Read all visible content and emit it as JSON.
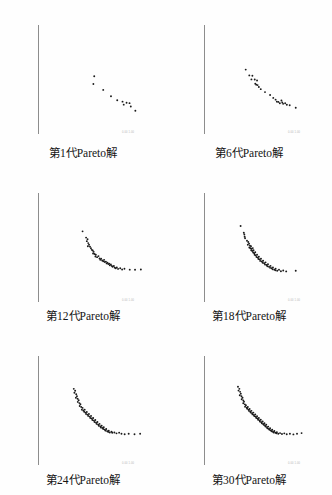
{
  "figure": {
    "type": "scatter-grid",
    "columns": 2,
    "rows": 3,
    "background_color": "#fefefe",
    "axis_color": "#8d8d8d",
    "point_color": "#1a1a1a",
    "axis_micro_label": "0.00  1.00"
  },
  "chart_data": [
    {
      "type": "scatter",
      "title": "第1代Pareto解",
      "generation": 1,
      "point_count": 11,
      "xlabel": "",
      "ylabel": "",
      "grid": false,
      "legend": null,
      "projection": "3d-axes",
      "xlim": [
        0,
        1
      ],
      "ylim": [
        0,
        1
      ],
      "points": [
        [
          0.455,
          0.615
        ],
        [
          0.447,
          0.528
        ],
        [
          0.54,
          0.462
        ],
        [
          0.613,
          0.39
        ],
        [
          0.672,
          0.345
        ],
        [
          0.722,
          0.33
        ],
        [
          0.733,
          0.296
        ],
        [
          0.76,
          0.318
        ],
        [
          0.788,
          0.313
        ],
        [
          0.8,
          0.275
        ],
        [
          0.843,
          0.228
        ]
      ]
    },
    {
      "type": "scatter",
      "title": "第6代Pareto解",
      "generation": 6,
      "point_count": 25,
      "xlabel": "",
      "ylabel": "",
      "grid": false,
      "legend": null,
      "projection": "3d-axes",
      "xlim": [
        0,
        1
      ],
      "ylim": [
        0,
        1
      ],
      "points": [
        [
          0.318,
          0.69
        ],
        [
          0.352,
          0.625
        ],
        [
          0.381,
          0.62
        ],
        [
          0.372,
          0.58
        ],
        [
          0.403,
          0.578
        ],
        [
          0.425,
          0.568
        ],
        [
          0.408,
          0.532
        ],
        [
          0.417,
          0.521
        ],
        [
          0.43,
          0.516
        ],
        [
          0.442,
          0.495
        ],
        [
          0.46,
          0.47
        ],
        [
          0.5,
          0.437
        ],
        [
          0.548,
          0.405
        ],
        [
          0.578,
          0.372
        ],
        [
          0.6,
          0.352
        ],
        [
          0.612,
          0.33
        ],
        [
          0.626,
          0.327
        ],
        [
          0.64,
          0.312
        ],
        [
          0.655,
          0.342
        ],
        [
          0.663,
          0.32
        ],
        [
          0.671,
          0.305
        ],
        [
          0.69,
          0.312
        ],
        [
          0.706,
          0.295
        ],
        [
          0.733,
          0.29
        ],
        [
          0.79,
          0.262
        ]
      ]
    },
    {
      "type": "scatter",
      "title": "第12代Pareto解",
      "generation": 12,
      "point_count": 45,
      "xlabel": "",
      "ylabel": "",
      "grid": false,
      "legend": null,
      "projection": "3d-axes",
      "xlim": [
        0,
        1
      ],
      "ylim": [
        0,
        1
      ],
      "points": [
        [
          0.345,
          0.76
        ],
        [
          0.378,
          0.69
        ],
        [
          0.392,
          0.672
        ],
        [
          0.385,
          0.65
        ],
        [
          0.398,
          0.628
        ],
        [
          0.406,
          0.61
        ],
        [
          0.395,
          0.592
        ],
        [
          0.415,
          0.588
        ],
        [
          0.424,
          0.57
        ],
        [
          0.432,
          0.552
        ],
        [
          0.441,
          0.545
        ],
        [
          0.45,
          0.53
        ],
        [
          0.444,
          0.512
        ],
        [
          0.458,
          0.505
        ],
        [
          0.47,
          0.498
        ],
        [
          0.466,
          0.478
        ],
        [
          0.482,
          0.47
        ],
        [
          0.495,
          0.482
        ],
        [
          0.505,
          0.455
        ],
        [
          0.512,
          0.44
        ],
        [
          0.52,
          0.452
        ],
        [
          0.53,
          0.432
        ],
        [
          0.54,
          0.425
        ],
        [
          0.548,
          0.44
        ],
        [
          0.555,
          0.415
        ],
        [
          0.565,
          0.42
        ],
        [
          0.572,
          0.4
        ],
        [
          0.58,
          0.408
        ],
        [
          0.588,
          0.392
        ],
        [
          0.596,
          0.398
        ],
        [
          0.602,
          0.38
        ],
        [
          0.612,
          0.388
        ],
        [
          0.62,
          0.372
        ],
        [
          0.628,
          0.362
        ],
        [
          0.64,
          0.37
        ],
        [
          0.648,
          0.352
        ],
        [
          0.658,
          0.345
        ],
        [
          0.668,
          0.355
        ],
        [
          0.68,
          0.338
        ],
        [
          0.7,
          0.345
        ],
        [
          0.718,
          0.332
        ],
        [
          0.74,
          0.34
        ],
        [
          0.79,
          0.33
        ],
        [
          0.84,
          0.328
        ],
        [
          0.895,
          0.332
        ]
      ]
    },
    {
      "type": "scatter",
      "title": "第18代Pareto解",
      "generation": 18,
      "point_count": 55,
      "xlabel": "",
      "ylabel": "",
      "grid": false,
      "legend": null,
      "projection": "3d-axes",
      "xlim": [
        0,
        1
      ],
      "ylim": [
        0,
        1
      ],
      "points": [
        [
          0.27,
          0.82
        ],
        [
          0.3,
          0.745
        ],
        [
          0.305,
          0.725
        ],
        [
          0.308,
          0.7
        ],
        [
          0.312,
          0.682
        ],
        [
          0.33,
          0.655
        ],
        [
          0.342,
          0.64
        ],
        [
          0.35,
          0.622
        ],
        [
          0.338,
          0.61
        ],
        [
          0.358,
          0.6
        ],
        [
          0.368,
          0.592
        ],
        [
          0.352,
          0.578
        ],
        [
          0.362,
          0.57
        ],
        [
          0.375,
          0.565
        ],
        [
          0.385,
          0.572
        ],
        [
          0.37,
          0.548
        ],
        [
          0.38,
          0.54
        ],
        [
          0.392,
          0.548
        ],
        [
          0.388,
          0.522
        ],
        [
          0.398,
          0.515
        ],
        [
          0.408,
          0.525
        ],
        [
          0.402,
          0.498
        ],
        [
          0.412,
          0.49
        ],
        [
          0.425,
          0.498
        ],
        [
          0.42,
          0.472
        ],
        [
          0.432,
          0.465
        ],
        [
          0.442,
          0.475
        ],
        [
          0.438,
          0.45
        ],
        [
          0.45,
          0.445
        ],
        [
          0.462,
          0.452
        ],
        [
          0.455,
          0.428
        ],
        [
          0.47,
          0.422
        ],
        [
          0.482,
          0.43
        ],
        [
          0.478,
          0.408
        ],
        [
          0.492,
          0.402
        ],
        [
          0.505,
          0.412
        ],
        [
          0.5,
          0.388
        ],
        [
          0.515,
          0.382
        ],
        [
          0.528,
          0.39
        ],
        [
          0.522,
          0.368
        ],
        [
          0.538,
          0.362
        ],
        [
          0.552,
          0.372
        ],
        [
          0.548,
          0.35
        ],
        [
          0.562,
          0.345
        ],
        [
          0.575,
          0.355
        ],
        [
          0.572,
          0.335
        ],
        [
          0.588,
          0.33
        ],
        [
          0.6,
          0.34
        ],
        [
          0.598,
          0.322
        ],
        [
          0.615,
          0.318
        ],
        [
          0.632,
          0.328
        ],
        [
          0.65,
          0.312
        ],
        [
          0.672,
          0.32
        ],
        [
          0.7,
          0.31
        ],
        [
          0.79,
          0.318
        ]
      ]
    },
    {
      "type": "scatter",
      "title": "第24代Pareto解",
      "generation": 24,
      "point_count": 62,
      "xlabel": "",
      "ylabel": "",
      "grid": false,
      "legend": null,
      "projection": "3d-axes",
      "xlim": [
        0,
        1
      ],
      "ylim": [
        0,
        1
      ],
      "points": [
        [
          0.262,
          0.822
        ],
        [
          0.275,
          0.8
        ],
        [
          0.268,
          0.778
        ],
        [
          0.285,
          0.762
        ],
        [
          0.292,
          0.74
        ],
        [
          0.282,
          0.722
        ],
        [
          0.298,
          0.71
        ],
        [
          0.308,
          0.695
        ],
        [
          0.3,
          0.675
        ],
        [
          0.315,
          0.662
        ],
        [
          0.325,
          0.65
        ],
        [
          0.318,
          0.63
        ],
        [
          0.332,
          0.618
        ],
        [
          0.345,
          0.608
        ],
        [
          0.338,
          0.588
        ],
        [
          0.352,
          0.578
        ],
        [
          0.365,
          0.588
        ],
        [
          0.36,
          0.565
        ],
        [
          0.372,
          0.555
        ],
        [
          0.385,
          0.562
        ],
        [
          0.378,
          0.54
        ],
        [
          0.392,
          0.532
        ],
        [
          0.405,
          0.54
        ],
        [
          0.398,
          0.518
        ],
        [
          0.412,
          0.51
        ],
        [
          0.425,
          0.518
        ],
        [
          0.418,
          0.495
        ],
        [
          0.432,
          0.488
        ],
        [
          0.445,
          0.495
        ],
        [
          0.438,
          0.472
        ],
        [
          0.452,
          0.465
        ],
        [
          0.465,
          0.472
        ],
        [
          0.458,
          0.45
        ],
        [
          0.472,
          0.442
        ],
        [
          0.485,
          0.45
        ],
        [
          0.478,
          0.428
        ],
        [
          0.492,
          0.42
        ],
        [
          0.505,
          0.428
        ],
        [
          0.498,
          0.408
        ],
        [
          0.512,
          0.4
        ],
        [
          0.525,
          0.408
        ],
        [
          0.518,
          0.388
        ],
        [
          0.532,
          0.382
        ],
        [
          0.545,
          0.39
        ],
        [
          0.54,
          0.37
        ],
        [
          0.555,
          0.362
        ],
        [
          0.568,
          0.37
        ],
        [
          0.562,
          0.352
        ],
        [
          0.578,
          0.345
        ],
        [
          0.592,
          0.352
        ],
        [
          0.588,
          0.338
        ],
        [
          0.602,
          0.332
        ],
        [
          0.618,
          0.34
        ],
        [
          0.625,
          0.328
        ],
        [
          0.645,
          0.332
        ],
        [
          0.665,
          0.322
        ],
        [
          0.69,
          0.33
        ],
        [
          0.712,
          0.318
        ],
        [
          0.742,
          0.312
        ],
        [
          0.78,
          0.318
        ],
        [
          0.835,
          0.312
        ],
        [
          0.888,
          0.318
        ]
      ]
    },
    {
      "type": "scatter",
      "title": "第30代Pareto解",
      "generation": 30,
      "point_count": 72,
      "xlabel": "",
      "ylabel": "",
      "grid": false,
      "legend": null,
      "projection": "3d-axes",
      "xlim": [
        0,
        1
      ],
      "ylim": [
        0,
        1
      ],
      "points": [
        [
          0.245,
          0.845
        ],
        [
          0.258,
          0.822
        ],
        [
          0.25,
          0.802
        ],
        [
          0.265,
          0.788
        ],
        [
          0.272,
          0.768
        ],
        [
          0.262,
          0.75
        ],
        [
          0.278,
          0.738
        ],
        [
          0.288,
          0.722
        ],
        [
          0.28,
          0.705
        ],
        [
          0.295,
          0.692
        ],
        [
          0.302,
          0.678
        ],
        [
          0.295,
          0.66
        ],
        [
          0.31,
          0.648
        ],
        [
          0.32,
          0.638
        ],
        [
          0.312,
          0.62
        ],
        [
          0.328,
          0.61
        ],
        [
          0.338,
          0.618
        ],
        [
          0.332,
          0.598
        ],
        [
          0.345,
          0.588
        ],
        [
          0.355,
          0.595
        ],
        [
          0.348,
          0.575
        ],
        [
          0.36,
          0.568
        ],
        [
          0.372,
          0.575
        ],
        [
          0.365,
          0.555
        ],
        [
          0.378,
          0.548
        ],
        [
          0.39,
          0.555
        ],
        [
          0.382,
          0.535
        ],
        [
          0.395,
          0.528
        ],
        [
          0.408,
          0.535
        ],
        [
          0.4,
          0.515
        ],
        [
          0.412,
          0.508
        ],
        [
          0.425,
          0.515
        ],
        [
          0.418,
          0.495
        ],
        [
          0.43,
          0.488
        ],
        [
          0.442,
          0.495
        ],
        [
          0.435,
          0.475
        ],
        [
          0.448,
          0.468
        ],
        [
          0.46,
          0.475
        ],
        [
          0.452,
          0.455
        ],
        [
          0.465,
          0.448
        ],
        [
          0.478,
          0.455
        ],
        [
          0.47,
          0.435
        ],
        [
          0.482,
          0.428
        ],
        [
          0.495,
          0.435
        ],
        [
          0.488,
          0.418
        ],
        [
          0.5,
          0.41
        ],
        [
          0.512,
          0.418
        ],
        [
          0.505,
          0.398
        ],
        [
          0.518,
          0.392
        ],
        [
          0.53,
          0.398
        ],
        [
          0.522,
          0.38
        ],
        [
          0.535,
          0.372
        ],
        [
          0.548,
          0.38
        ],
        [
          0.542,
          0.362
        ],
        [
          0.555,
          0.355
        ],
        [
          0.568,
          0.362
        ],
        [
          0.562,
          0.345
        ],
        [
          0.575,
          0.34
        ],
        [
          0.588,
          0.348
        ],
        [
          0.582,
          0.332
        ],
        [
          0.598,
          0.328
        ],
        [
          0.612,
          0.335
        ],
        [
          0.608,
          0.322
        ],
        [
          0.625,
          0.318
        ],
        [
          0.642,
          0.325
        ],
        [
          0.66,
          0.315
        ],
        [
          0.682,
          0.322
        ],
        [
          0.705,
          0.312
        ],
        [
          0.735,
          0.318
        ],
        [
          0.768,
          0.31
        ],
        [
          0.802,
          0.318
        ],
        [
          0.845,
          0.325
        ]
      ]
    }
  ]
}
